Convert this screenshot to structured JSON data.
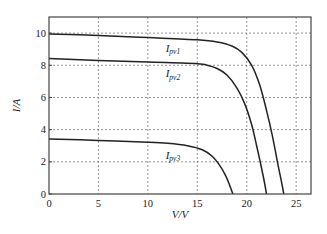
{
  "chart_data": {
    "type": "line",
    "title": "",
    "xlabel": "V/V",
    "ylabel": "I/A",
    "xlim": [
      0,
      26.5
    ],
    "ylim": [
      0,
      11
    ],
    "xticks": [
      0,
      5,
      10,
      15,
      20,
      25
    ],
    "yticks": [
      0,
      2,
      4,
      6,
      8,
      10
    ],
    "grid": true,
    "series": [
      {
        "name": "Ipv1",
        "label_main": "I",
        "label_sub": "pv1",
        "x": [
          0,
          5,
          10,
          15,
          17,
          18.5,
          19.5,
          20.5,
          21.3,
          22,
          22.6,
          23.1,
          23.5,
          23.75
        ],
        "y": [
          9.95,
          9.85,
          9.72,
          9.58,
          9.45,
          9.2,
          8.8,
          8.0,
          6.8,
          5.2,
          3.6,
          2.0,
          0.8,
          0
        ]
      },
      {
        "name": "Ipv2",
        "label_main": "I",
        "label_sub": "pv2",
        "x": [
          0,
          5,
          10,
          15,
          16,
          17,
          18,
          19,
          19.8,
          20.5,
          21,
          21.5,
          21.8,
          22
        ],
        "y": [
          8.42,
          8.3,
          8.2,
          8.1,
          8.0,
          7.8,
          7.4,
          6.6,
          5.6,
          4.3,
          3.0,
          1.6,
          0.7,
          0
        ]
      },
      {
        "name": "Ipv3",
        "label_main": "I",
        "label_sub": "pv3",
        "x": [
          0,
          5,
          10,
          12,
          14,
          15.5,
          16.5,
          17.3,
          17.9,
          18.3,
          18.6
        ],
        "y": [
          3.42,
          3.33,
          3.22,
          3.15,
          3.0,
          2.75,
          2.35,
          1.75,
          1.1,
          0.5,
          0
        ]
      }
    ],
    "annotations": [
      {
        "text_main": "I",
        "text_sub": "pv1",
        "x": 11.8,
        "y": 8.85
      },
      {
        "text_main": "I",
        "text_sub": "pv2",
        "x": 11.8,
        "y": 7.25
      },
      {
        "text_main": "I",
        "text_sub": "pv3",
        "x": 11.8,
        "y": 2.2
      }
    ]
  }
}
